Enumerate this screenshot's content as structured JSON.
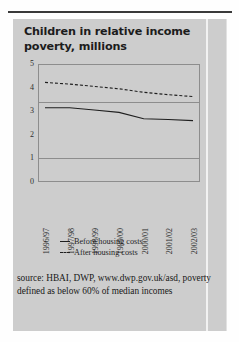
{
  "title": "Children in relative income poverty, millions",
  "source_note": "source: HBAI, DWP, www.dwp.gov.uk/asd, poverty defined as below 60% of median incomes",
  "legend": [
    {
      "label": "Before housing costs",
      "style": "solid"
    },
    {
      "label": "After housing costs",
      "style": "dashed"
    }
  ],
  "chart_data": {
    "type": "line",
    "title": "Children in relative income poverty, millions",
    "xlabel": "",
    "ylabel": "millions",
    "ylim": [
      0,
      5
    ],
    "yticks": [
      0,
      1,
      2,
      3,
      4,
      5
    ],
    "gridlines": [
      1,
      3.4
    ],
    "grid": true,
    "legend_position": "bottom",
    "categories": [
      "1996/97",
      "1997/98",
      "1998/99",
      "1999/00",
      "2000/01",
      "2001/02",
      "2002/03"
    ],
    "series": [
      {
        "name": "Before housing costs",
        "style": "solid",
        "values": [
          3.15,
          3.15,
          3.05,
          2.95,
          2.68,
          2.65,
          2.6
        ]
      },
      {
        "name": "After housing costs",
        "style": "dashed",
        "values": [
          4.22,
          4.15,
          4.05,
          3.95,
          3.8,
          3.7,
          3.62
        ]
      }
    ],
    "annotations": []
  }
}
